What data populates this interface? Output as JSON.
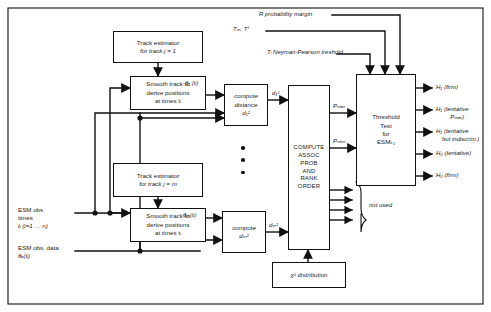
{
  "figure": {
    "type": "block-diagram",
    "width": 491,
    "height": 312
  },
  "boxes": {
    "track_estimator_1": {
      "line1": "Track estimator",
      "line2": "for track j = 1"
    },
    "smooth_track_1": {
      "line1": "Smooth track to",
      "line2": "derive positions",
      "line3": "at times tᵢ"
    },
    "compute_distance_1": {
      "line1": "compute",
      "line2": "distance",
      "line3": "d₁²"
    },
    "track_estimator_m": {
      "line1": "Track estimator",
      "line2": "for track j = m"
    },
    "smooth_track_m": {
      "line1": "Smooth track to",
      "line2": "derive positions",
      "line3": "at times tᵢ"
    },
    "compute_distance_m": {
      "line1": "compute",
      "line2": "dₘ²"
    },
    "compute_assoc": {
      "line1": "COMPUTE",
      "line2": "ASSOC",
      "line3": "PROB",
      "line4": "AND",
      "line5": "RANK",
      "line6": "ORDER"
    },
    "threshold_test": {
      "line1": "Threshold",
      "line2": "Test",
      "line3": "for",
      "line4": "ESMₖ₁"
    },
    "chi_square": {
      "line1": "χ² distribution"
    }
  },
  "signals": {
    "theta_1": "θ₁ (tᵢ)",
    "theta_m": "θₘ(tᵢ)",
    "d1_sq": "d₁²",
    "dm_sq": "dₘ²",
    "p_max": "Pₘₐₓ",
    "p_next": "Pₙₑₓₜ"
  },
  "top_inputs": {
    "r_margin": "R probability margin",
    "t_m_t_f": "Tₘ, Tᶠ",
    "neyman_pearson": "Tᵢ Neyman-Pearson treshold"
  },
  "left_inputs": {
    "esm_times": {
      "line1": "ESM obs",
      "line2": "times",
      "line3": "tᵢ (i=1 … n)"
    },
    "esm_data": {
      "line1": "ESM obs. data",
      "line2": "θₐ(tᵢ)"
    }
  },
  "outputs": [
    {
      "line1": "H₁ (firm)",
      "line2": ""
    },
    {
      "line1": "H₁ (tentative",
      "line2": "Pₘₐₓ)"
    },
    {
      "line1": "H₁ (tentative",
      "line2": "but indiscrim.)"
    },
    {
      "line1": "H₀ (tentative)",
      "line2": ""
    },
    {
      "line1": "H₀ (firm)",
      "line2": ""
    }
  ],
  "annotations": {
    "not_used": "not used"
  },
  "colors": {
    "stroke": "#111111",
    "background": "#ffffff"
  }
}
